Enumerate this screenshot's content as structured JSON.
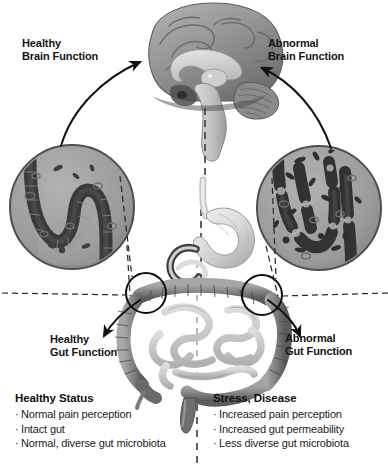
{
  "diagram": {
    "background_color": "#ffffff",
    "text_color": "#141414"
  },
  "labels": {
    "healthy_brain_line1": "Healthy",
    "healthy_brain_line2": "Brain Function",
    "abnormal_brain_line1": "Abnormal",
    "abnormal_brain_line2": "Brain Function",
    "healthy_gut_line1": "Healthy",
    "healthy_gut_line2": "Gut Function",
    "abnormal_gut_line1": "Abnormal",
    "abnormal_gut_line2": "Gut Function"
  },
  "status": {
    "healthy": {
      "title": "Healthy Status",
      "bullets": [
        "Normal pain perception",
        "Intact gut",
        "Normal, diverse gut microbiota"
      ]
    },
    "stress": {
      "title": "Stress, Disease",
      "bullets": [
        "Increased pain perception",
        "Increased gut permeability",
        "Less diverse gut microbiota"
      ]
    }
  },
  "illustrations": {
    "brain": {
      "name": "sagittal-brain-cross-section",
      "position": "top-center",
      "parts": [
        "cerebral cortex",
        "corpus callosum",
        "thalamus",
        "cerebellum",
        "brainstem"
      ]
    },
    "gut_healthy": {
      "name": "healthy-intestinal-epithelium",
      "position": "left",
      "description": "intact continuous epithelial villi layer with few bacteria"
    },
    "gut_abnormal": {
      "name": "abnormal-intestinal-epithelium",
      "position": "right",
      "description": "broken permeable epithelium with gaps and many bacteria"
    },
    "digestive": {
      "name": "digestive-tract",
      "position": "center",
      "parts": [
        "esophagus",
        "stomach",
        "duodenum",
        "small intestine",
        "large intestine",
        "rectum"
      ]
    }
  },
  "connectors": {
    "vagus_axis": "vertical dashed line from brainstem through stomach to rectum",
    "arrow_healthy_up": "curved arrow from healthy gut circle to brain",
    "arrow_abnormal_up": "curved arrow from abnormal gut circle to brain",
    "arrow_healthy_down": "curved arrow from brain down to healthy gut function",
    "arrow_abnormal_down": "curved arrow from brain down to abnormal gut function",
    "callout_left": "dashed leader lines from left colon flexure to healthy gut inset",
    "callout_right": "dashed leader lines from right colon flexure to abnormal gut inset"
  },
  "colors": {
    "circle_fill": "#9a9a9a",
    "circle_stroke": "#4a4a4a",
    "epithelium": "#3c3c3c",
    "organ_mid": "#8d8d8d",
    "organ_dark": "#5a5a5a",
    "organ_light": "#d7d7d7",
    "line": "#1a1a1a"
  }
}
